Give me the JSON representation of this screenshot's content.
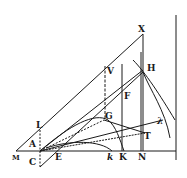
{
  "figure": {
    "type": "geometric-construction",
    "ink_color": "#1a1a1a",
    "background": "#ffffff",
    "labels": {
      "X": "X",
      "H": "H",
      "V": "V",
      "F": "F",
      "G": "G",
      "L": "L",
      "A": "A",
      "M": "M",
      "C": "C",
      "E": "E",
      "k": "k",
      "K": "K",
      "N": "N",
      "T": "T",
      "lambda": "λ"
    }
  }
}
